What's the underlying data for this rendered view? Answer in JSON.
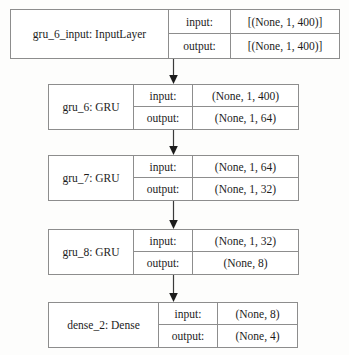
{
  "diagram": {
    "shape_labels": {
      "input": "input:",
      "output": "output:"
    },
    "colors": {
      "background": "#fdfdfc",
      "box_fill": "#ffffff",
      "border": "#8d8d8d",
      "text": "#1c1c1c",
      "arrow": "#3a3a3a"
    },
    "layers": [
      {
        "id": "gru_6_input",
        "name": "gru_6_input: InputLayer",
        "input_shape": "[(None, 1, 400)]",
        "output_shape": "[(None, 1, 400)]"
      },
      {
        "id": "gru_6",
        "name": "gru_6: GRU",
        "input_shape": "(None, 1, 400)",
        "output_shape": "(None, 1, 64)"
      },
      {
        "id": "gru_7",
        "name": "gru_7: GRU",
        "input_shape": "(None, 1, 64)",
        "output_shape": "(None, 1, 32)"
      },
      {
        "id": "gru_8",
        "name": "gru_8: GRU",
        "input_shape": "(None, 1, 32)",
        "output_shape": "(None, 8)"
      },
      {
        "id": "dense_2",
        "name": "dense_2: Dense",
        "input_shape": "(None, 8)",
        "output_shape": "(None, 4)"
      }
    ],
    "connections": [
      {
        "from": "gru_6_input",
        "to": "gru_6"
      },
      {
        "from": "gru_6",
        "to": "gru_7"
      },
      {
        "from": "gru_7",
        "to": "gru_8"
      },
      {
        "from": "gru_8",
        "to": "dense_2"
      }
    ]
  }
}
